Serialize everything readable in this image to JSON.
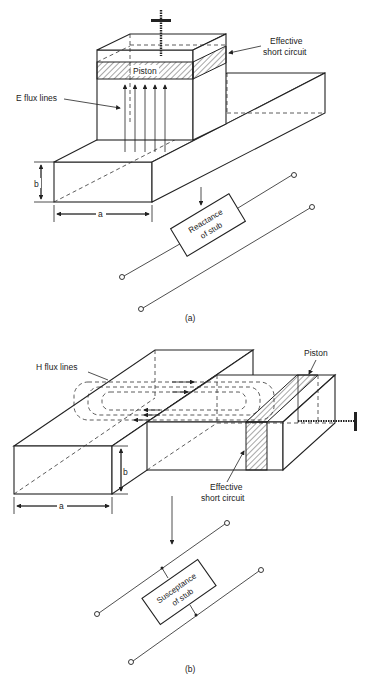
{
  "figure_a": {
    "caption": "(a)",
    "labels": {
      "effective_short_circuit_line1": "Effective",
      "effective_short_circuit_line2": "short circuit",
      "piston": "Piston",
      "e_flux_lines": "E flux lines",
      "dim_b": "b",
      "dim_a": "a",
      "stub_line1": "Reactance",
      "stub_line2": "of stub"
    }
  },
  "figure_b": {
    "caption": "(b)",
    "labels": {
      "h_flux_lines": "H flux lines",
      "piston": "Piston",
      "effective_short_circuit_line1": "Effective",
      "effective_short_circuit_line2": "short circuit",
      "dim_b": "b",
      "dim_a": "a",
      "stub_line1": "Susceptance",
      "stub_line2": "of stub"
    }
  },
  "colors": {
    "ink": "#222222",
    "background": "#ffffff"
  }
}
